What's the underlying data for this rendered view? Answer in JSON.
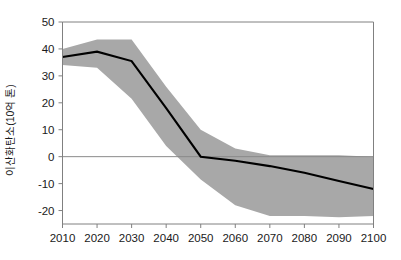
{
  "chart_data": {
    "type": "line",
    "title": "",
    "subtitle": "",
    "xlabel": "",
    "ylabel": "이산화탄소(10억 톤)",
    "xlim": [
      2010,
      2100
    ],
    "ylim": [
      -25,
      50
    ],
    "grid": false,
    "legend_position": "none",
    "x_ticks": [
      2010,
      2020,
      2030,
      2040,
      2050,
      2060,
      2070,
      2080,
      2090,
      2100
    ],
    "x_tick_labels": [
      "2010",
      "2020",
      "2030",
      "2040",
      "2050",
      "2060",
      "2070",
      "2080",
      "2090",
      "2100"
    ],
    "y_ticks": [
      -20,
      -10,
      0,
      10,
      20,
      30,
      40,
      50
    ],
    "y_tick_labels": [
      "-20",
      "-10",
      "0",
      "10",
      "20",
      "30",
      "40",
      "50"
    ],
    "zero_line": 0,
    "x": [
      2010,
      2020,
      2030,
      2040,
      2050,
      2060,
      2070,
      2080,
      2090,
      2100
    ],
    "series": [
      {
        "name": "중앙 추정치",
        "type": "line",
        "color": "#000000",
        "values": [
          37,
          39,
          35.5,
          18,
          0,
          -1.5,
          -3.5,
          -6,
          -9,
          -12
        ]
      }
    ],
    "band": {
      "name": "불확실성 범위",
      "color": "#a8a8a8",
      "upper": [
        40,
        43.5,
        43.5,
        26,
        10,
        3,
        0.5,
        0.5,
        0.5,
        0
      ],
      "lower": [
        34,
        33,
        21.5,
        4,
        -8.5,
        -18,
        -22,
        -22,
        -22.5,
        -22
      ]
    },
    "annotations": []
  },
  "axis": {
    "frame_color": "#808080",
    "tick_color": "#808080",
    "zero_line_color": "#8a8a8a"
  }
}
